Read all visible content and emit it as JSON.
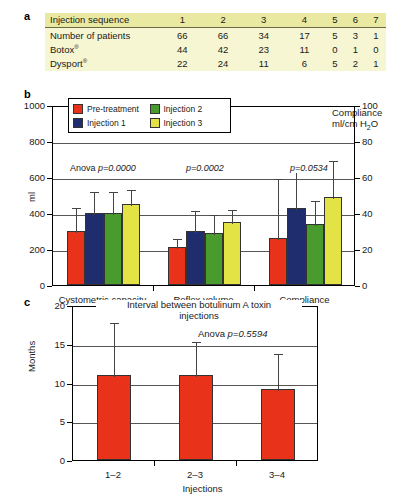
{
  "panels": {
    "a": {
      "letter": "a"
    },
    "b": {
      "letter": "b"
    },
    "c": {
      "letter": "c"
    }
  },
  "table": {
    "header": [
      "Injection sequence",
      "1",
      "2",
      "3",
      "4",
      "5",
      "6",
      "7"
    ],
    "rows": [
      {
        "label": "Number of patients",
        "sup": "",
        "values": [
          "66",
          "66",
          "34",
          "17",
          "5",
          "3",
          "1"
        ]
      },
      {
        "label": "Botox",
        "sup": "®",
        "values": [
          "44",
          "42",
          "23",
          "11",
          "0",
          "1",
          "0"
        ]
      },
      {
        "label": "Dysport",
        "sup": "®",
        "values": [
          "22",
          "24",
          "11",
          "6",
          "5",
          "2",
          "1"
        ]
      }
    ]
  },
  "colors": {
    "pre_treatment": "#e8321a",
    "injection_1": "#1f2d6e",
    "injection_2": "#4a9b2e",
    "injection_3": "#e3e345",
    "table_header": "#e9e9a2",
    "table_body": "#f6f6d2"
  },
  "legend": {
    "items": [
      {
        "label": "Pre-treatment",
        "color": "#e8321a"
      },
      {
        "label": "Injection 2",
        "color": "#4a9b2e"
      },
      {
        "label": "Injection 1",
        "color": "#1f2d6e"
      },
      {
        "label": "Injection 3",
        "color": "#e3e345"
      }
    ]
  },
  "chart_data": [
    {
      "type": "bar",
      "panel": "b",
      "title": "",
      "categories": [
        "Cystometric capacity",
        "Reflex volume",
        "Compliance"
      ],
      "xlabel": "",
      "ylabel": "ml",
      "ylim": [
        0,
        1000
      ],
      "yticks": [
        0,
        200,
        400,
        600,
        800,
        1000
      ],
      "y2label": "Compliance ml/cm H2O",
      "y2lim": [
        0,
        100
      ],
      "y2ticks": [
        0,
        20,
        40,
        60,
        80,
        100
      ],
      "grid": true,
      "legend_position": "top-left",
      "series": [
        {
          "name": "Pre-treatment",
          "color": "#e8321a",
          "values": [
            300,
            210,
            26
          ],
          "errors_high": [
            440,
            265,
            60
          ]
        },
        {
          "name": "Injection 1",
          "color": "#1f2d6e",
          "values": [
            400,
            300,
            43
          ],
          "errors_high": [
            530,
            420,
            68
          ]
        },
        {
          "name": "Injection 2",
          "color": "#4a9b2e",
          "values": [
            400,
            290,
            34
          ],
          "errors_high": [
            530,
            400,
            48
          ]
        },
        {
          "name": "Injection 3",
          "color": "#e3e345",
          "values": [
            450,
            350,
            49
          ],
          "errors_high": [
            540,
            430,
            70
          ]
        }
      ],
      "annotations": [
        {
          "text": "Anova p=0.0000",
          "group": "Cystometric capacity"
        },
        {
          "text": "p=0.0002",
          "group": "Reflex volume"
        },
        {
          "text": "p=0.0534",
          "group": "Compliance"
        }
      ]
    },
    {
      "type": "bar",
      "panel": "c",
      "title": "Interval between botulinum A toxin injections",
      "categories": [
        "1–2",
        "2–3",
        "3–4"
      ],
      "xlabel": "Injections",
      "ylabel": "Months",
      "ylim": [
        0,
        20
      ],
      "yticks": [
        0,
        5,
        10,
        15,
        20
      ],
      "grid": true,
      "series": [
        {
          "name": "Interval",
          "color": "#e8321a",
          "values": [
            11.0,
            11.0,
            9.2
          ],
          "errors_high": [
            18.0,
            15.5,
            14.0
          ]
        }
      ],
      "annotations": [
        {
          "text": "Anova p=0.5594"
        }
      ]
    }
  ],
  "panel_b_axis": {
    "y_left_ticks": [
      "1000",
      "800",
      "600",
      "400",
      "200",
      "0"
    ],
    "y_right_ticks": [
      "100",
      "80",
      "60",
      "40",
      "20",
      "0"
    ],
    "y_left_label": "ml",
    "y_right_label_line1": "Compliance",
    "y_right_label_line2_a": "ml/cm H",
    "y_right_label_line2_b": "2",
    "y_right_label_line2_c": "O",
    "categories": [
      "Cystometric capacity",
      "Reflex volume",
      "Compliance"
    ],
    "pvalues": [
      "Anova p=0.0000",
      "p=0.0002",
      "p=0.0534"
    ]
  },
  "panel_c_axis": {
    "y_ticks": [
      "20",
      "15",
      "10",
      "5",
      "0"
    ],
    "y_label": "Months",
    "x_label": "Injections",
    "categories": [
      "1–2",
      "2–3",
      "3–4"
    ],
    "title_line1": "Interval between botulinum A toxin",
    "title_line2": "injections",
    "pvalue_prefix": "Anova ",
    "pvalue": "p=0.5594"
  }
}
